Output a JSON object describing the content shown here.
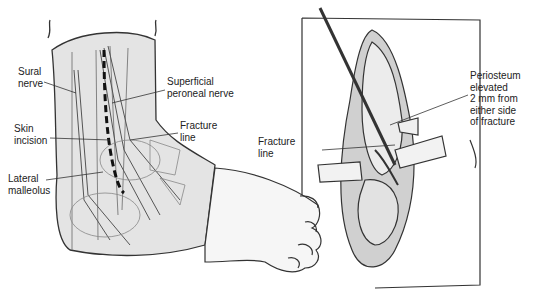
{
  "figure": {
    "left_panel": {
      "description": "Lateral view of ankle showing skin incision and nerves",
      "labels": {
        "sural_nerve": "Sural\nnerve",
        "superficial_peroneal_nerve": "Superficial\nperoneal nerve",
        "skin_incision": "Skin\nincision",
        "fracture_line": "Fracture\nline",
        "lateral_malleolus": "Lateral\nmalleolus"
      }
    },
    "right_panel": {
      "description": "Exposed fibula with retractors and elevated periosteum",
      "labels": {
        "fracture_line": "Fracture\nline",
        "periosteum": "Periosteum\nelevated\n2 mm from\neither side\nof fracture"
      }
    }
  },
  "colors": {
    "line": "#222222",
    "skin": "#e6e6e6",
    "shade": "#cfcfcf",
    "background": "#ffffff"
  }
}
